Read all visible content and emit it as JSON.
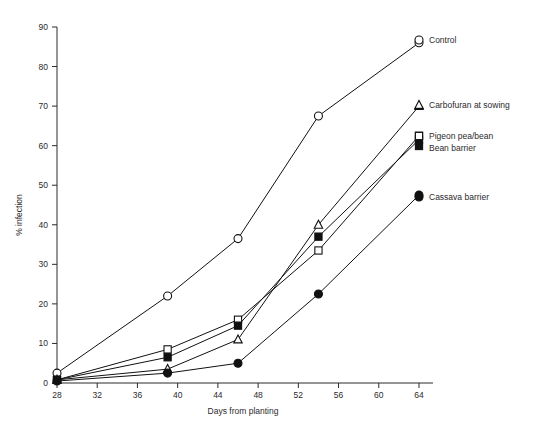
{
  "chart_data": {
    "type": "line",
    "title": "",
    "xlabel": "Days from planting",
    "ylabel": "% infection",
    "xlim": [
      28,
      64
    ],
    "ylim": [
      0,
      90
    ],
    "xticks": [
      28,
      32,
      36,
      40,
      44,
      48,
      52,
      56,
      60,
      64
    ],
    "yticks": [
      0,
      10,
      20,
      30,
      40,
      50,
      60,
      70,
      80,
      90
    ],
    "grid": false,
    "legend_position": "right-inline-at-line-ends",
    "series": [
      {
        "name": "Control",
        "marker": "open-circle",
        "x": [
          28,
          39,
          46,
          54,
          64
        ],
        "values": [
          2.5,
          22,
          36.5,
          67.5,
          86
        ]
      },
      {
        "name": "Carbofuran at sowing",
        "marker": "open-triangle",
        "x": [
          28,
          39,
          46,
          54,
          64
        ],
        "values": [
          0.8,
          3.5,
          11,
          40,
          70
        ]
      },
      {
        "name": "Pigeon pea/bean",
        "marker": "open-square",
        "x": [
          28,
          39,
          46,
          54,
          64
        ],
        "values": [
          0.8,
          8.5,
          16,
          33.5,
          62.5
        ]
      },
      {
        "name": "Bean barrier",
        "marker": "filled-square",
        "x": [
          28,
          39,
          46,
          54,
          64
        ],
        "values": [
          0.8,
          6.5,
          14.5,
          37,
          61.5
        ]
      },
      {
        "name": "Cassava barrier",
        "marker": "filled-circle",
        "x": [
          28,
          39,
          46,
          54,
          64
        ],
        "values": [
          0.5,
          2.5,
          5,
          22.5,
          47.5
        ]
      }
    ],
    "legend_entries": [
      {
        "label": "Control",
        "marker": "open-circle"
      },
      {
        "label": "Carbofuran at sowing",
        "marker": "open-triangle"
      },
      {
        "label": "Pigeon pea/bean",
        "marker": "open-square"
      },
      {
        "label": "Bean barrier",
        "marker": "filled-square"
      },
      {
        "label": "Cassava barrier",
        "marker": "filled-circle"
      }
    ]
  }
}
